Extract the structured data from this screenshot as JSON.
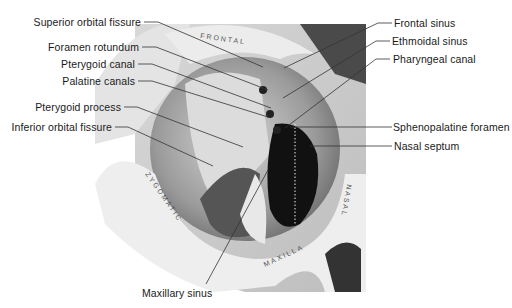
{
  "figure": {
    "labels_left": [
      {
        "id": "superior-orbital-fissure",
        "text": "Superior orbital fissure"
      },
      {
        "id": "foramen-rotundum",
        "text": "Foramen rotundum"
      },
      {
        "id": "pterygoid-canal",
        "text": "Pterygoid canal"
      },
      {
        "id": "palatine-canals",
        "text": "Palatine canals"
      },
      {
        "id": "pterygoid-process",
        "text": "Pterygoid process"
      },
      {
        "id": "inferior-orbital-fissure",
        "text": "Inferior orbital fissure"
      }
    ],
    "labels_right": [
      {
        "id": "frontal-sinus",
        "text": "Frontal sinus"
      },
      {
        "id": "ethmoidal-sinus",
        "text": "Ethmoidal sinus"
      },
      {
        "id": "pharyngeal-canal",
        "text": "Pharyngeal canal"
      },
      {
        "id": "sphenopalatine-foramen",
        "text": "Sphenopalatine foramen"
      },
      {
        "id": "nasal-septum",
        "text": "Nasal septum"
      }
    ],
    "labels_bottom": [
      {
        "id": "maxillary-sinus",
        "text": "Maxillary sinus"
      }
    ],
    "bone_labels": {
      "frontal": "FRONTAL",
      "zygomatic": "ZYGOMATIC",
      "maxilla": "MAXILLA",
      "nasal": "NASAL"
    },
    "colors": {
      "background": "#ffffff",
      "bone_light": "#e9e9e9",
      "bone_mid": "#c4c4c4",
      "shadow": "#7a7a7a",
      "cavity": "#111111",
      "leader_line": "#333333",
      "label_text": "#1a1a1a"
    }
  }
}
